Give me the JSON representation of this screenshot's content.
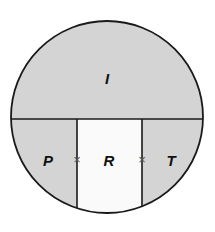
{
  "figure": {
    "background_color": "#ffffff",
    "outline_color": "#1a1a1a",
    "divider_color": "#1a1a1a",
    "shaded_fill": "#d4d4d4",
    "light_fill": "#fafafa",
    "mark_color": "#555555",
    "label_color": "#111111",
    "circle": {
      "center_x": 107,
      "center_y": 117,
      "radius": 96
    },
    "chord": {
      "y": 119
    },
    "dividers": [
      {
        "x": 77
      },
      {
        "x": 142
      }
    ]
  },
  "regions": [
    {
      "id": "top",
      "label": "I",
      "fill": "#d4d4d4",
      "label_x": 107,
      "label_y": 80
    },
    {
      "id": "bottom-left",
      "label": "P",
      "fill": "#d4d4d4",
      "label_x": 48,
      "label_y": 162
    },
    {
      "id": "bottom-middle",
      "label": "R",
      "fill": "#fafafa",
      "label_x": 109,
      "label_y": 162
    },
    {
      "id": "bottom-right",
      "label": "T",
      "fill": "#d4d4d4",
      "label_x": 171,
      "label_y": 162
    }
  ],
  "marks": [
    {
      "id": "left-cross",
      "label": "×",
      "x": 77,
      "y": 161
    },
    {
      "id": "right-cross",
      "label": "×",
      "x": 142,
      "y": 161
    }
  ]
}
